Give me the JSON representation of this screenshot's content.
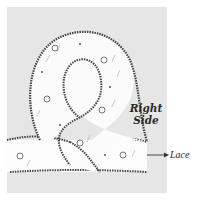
{
  "figure": {
    "type": "sewing illustration",
    "colors": {
      "background": "#e6e6e6",
      "page": "#ffffff",
      "fabric": "#fbfbfb",
      "edge_stitch": "#444444",
      "ink": "#2a2a2a"
    }
  },
  "labels": {
    "right_side_line1": "Right",
    "right_side_line2": "Side",
    "lace": "Lace"
  },
  "annotations": [
    {
      "text": "Right Side",
      "points_to": "looped fabric strip"
    },
    {
      "text": "Lace",
      "points_to": "horizontal lace band",
      "marker": "arrow"
    }
  ]
}
